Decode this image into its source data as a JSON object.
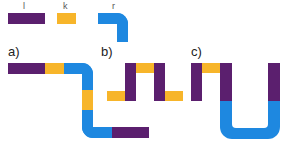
{
  "colors": {
    "l": "#5b1f6e",
    "k": "#f7b52a",
    "r": "#1e88e0"
  },
  "legend": {
    "items": [
      {
        "key": "l",
        "label": "l",
        "shape": "straight-long"
      },
      {
        "key": "k",
        "label": "k",
        "shape": "straight-short"
      },
      {
        "key": "r",
        "label": "r",
        "shape": "elbow"
      }
    ]
  },
  "panels": [
    {
      "id": "a",
      "label": "a)",
      "sequence": [
        "l",
        "k",
        "r",
        "k",
        "r",
        "l"
      ]
    },
    {
      "id": "b",
      "label": "b)",
      "sequence": [
        "k",
        "l",
        "k",
        "l",
        "k"
      ]
    },
    {
      "id": "c",
      "label": "c)",
      "sequence": [
        "l",
        "k",
        "l",
        "r",
        "r",
        "l"
      ]
    }
  ]
}
